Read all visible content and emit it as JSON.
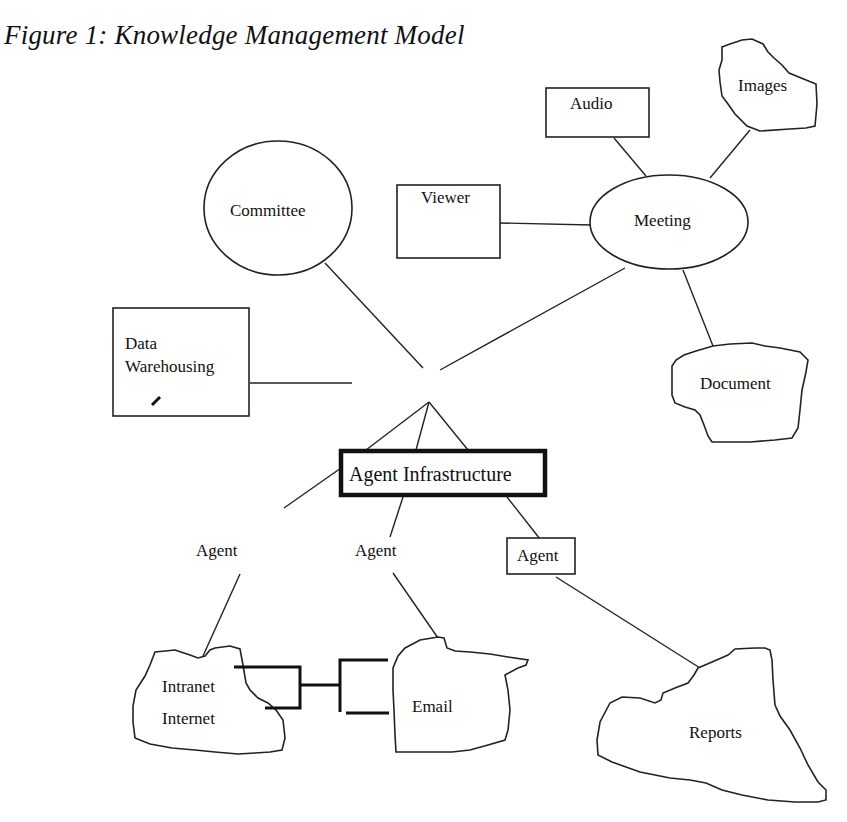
{
  "figure": {
    "title": "Figure 1: Knowledge Management Model"
  },
  "nodes": {
    "audio": "Audio",
    "images": "Images",
    "viewer": "Viewer",
    "meeting": "Meeting",
    "committee": "Committee",
    "data_warehousing_line1": "Data",
    "data_warehousing_line2": "Warehousing",
    "document": "Document",
    "agent_infrastructure": "Agent Infrastructure",
    "agent_left": "Agent",
    "agent_middle": "Agent",
    "agent_right": "Agent",
    "intranet": "Intranet",
    "internet": "Internet",
    "email": "Email",
    "reports": "Reports"
  },
  "style": {
    "line_color": "#222222",
    "background": "#ffffff"
  }
}
